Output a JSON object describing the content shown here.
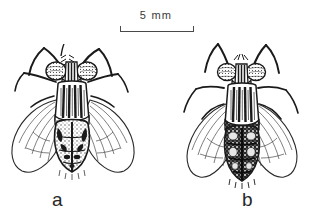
{
  "figure": {
    "type": "scientific-illustration",
    "background_color": "#ffffff",
    "ink_color": "#1a1a1a"
  },
  "scale_bar": {
    "label": "5 mm",
    "value": 5,
    "unit": "mm",
    "bar_length_px": 72,
    "tick_style": "end-caps-downward",
    "color": "#4a4a4a"
  },
  "specimens": [
    {
      "id": "a",
      "label": "a",
      "view": "dorsal",
      "abdomen_shade": "light-mottled",
      "thorax_stripes": 4,
      "wings": 2,
      "legs": 6
    },
    {
      "id": "b",
      "label": "b",
      "view": "dorsal",
      "abdomen_shade": "dark-speckled",
      "thorax_stripes": 4,
      "wings": 2,
      "legs": 6
    }
  ]
}
